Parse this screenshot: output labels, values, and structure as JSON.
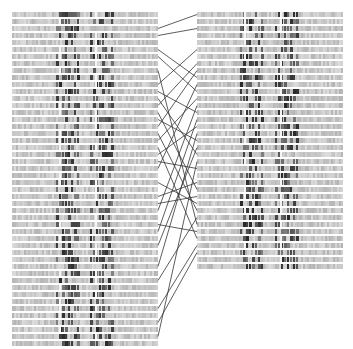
{
  "figure": {
    "width": 353,
    "height": 349,
    "background": "#ffffff",
    "strip_color": "#c4c4c4",
    "band_color": "#3a3a3a",
    "line_color": "#333333"
  },
  "left_stack": {
    "x": 12,
    "width": 146,
    "y_start": 12,
    "pitch": 7,
    "strip_height": 5,
    "row_count": 48,
    "gaps_x": [
      59,
      95
    ],
    "band_regions": [
      [
        56,
        78
      ],
      [
        90,
        112
      ]
    ]
  },
  "right_stack": {
    "x": 197,
    "width": 146,
    "y_start": 12,
    "pitch": 7,
    "strip_height": 5,
    "row_count": 37,
    "gaps_x": [
      244,
      280
    ],
    "band_regions": [
      [
        240,
        262
      ],
      [
        275,
        298
      ]
    ]
  },
  "connections": [
    [
      2,
      0
    ],
    [
      3,
      2
    ],
    [
      5,
      9
    ],
    [
      6,
      11
    ],
    [
      8,
      30
    ],
    [
      10,
      5
    ],
    [
      11,
      14
    ],
    [
      12,
      20
    ],
    [
      13,
      7
    ],
    [
      14,
      25
    ],
    [
      15,
      18
    ],
    [
      16,
      8
    ],
    [
      17,
      28
    ],
    [
      18,
      12
    ],
    [
      19,
      32
    ],
    [
      20,
      16
    ],
    [
      21,
      22
    ],
    [
      22,
      10
    ],
    [
      24,
      27
    ],
    [
      26,
      24
    ],
    [
      27,
      26
    ],
    [
      28,
      13
    ],
    [
      30,
      31
    ],
    [
      31,
      15
    ],
    [
      33,
      19
    ],
    [
      36,
      17
    ],
    [
      38,
      29
    ],
    [
      42,
      33
    ],
    [
      44,
      34
    ],
    [
      46,
      21
    ]
  ]
}
